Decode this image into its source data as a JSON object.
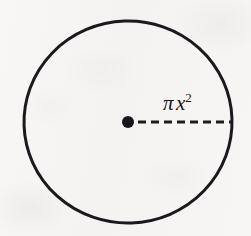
{
  "figure": {
    "kind": "geometry-diagram",
    "background_color": "#f6f5f3",
    "ink_color": "#17161a"
  },
  "circle": {
    "name": "circle-outline",
    "center_x": 128,
    "center_y": 122,
    "radius_x": 104,
    "radius_y": 101,
    "stroke_width": 3,
    "stroke_color": "#1a1a1e",
    "fill": "none"
  },
  "center_point": {
    "name": "center-dot",
    "x": 128,
    "y": 122,
    "radius": 6,
    "fill_color": "#17161a"
  },
  "radius_line": {
    "name": "radius-dashed-line",
    "x1": 138,
    "y1": 122,
    "x2": 231,
    "y2": 122,
    "stroke_width": 3,
    "stroke_color": "#1d1d21",
    "dash_length": 8,
    "dash_gap": 5,
    "dash_count": 7
  },
  "label": {
    "name": "radius-label",
    "text": "π x²",
    "pi": "π",
    "variable": "x",
    "exponent": "2",
    "x": 163,
    "y": 93,
    "font_size": 21,
    "style": "italic-serif",
    "color": "#17161a"
  }
}
